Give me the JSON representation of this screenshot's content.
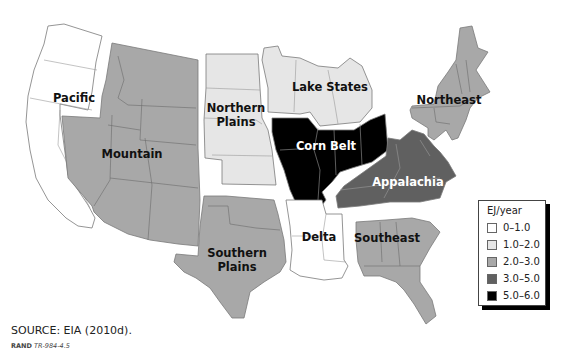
{
  "map": {
    "title": "",
    "unit_label": "EJ/year",
    "regions": [
      {
        "name": "Pacific",
        "bin": "0–1.0",
        "fill": "#ffffff",
        "label_color": "dark"
      },
      {
        "name": "Mountain",
        "bin": "2.0–3.0",
        "fill": "#a8a8a8",
        "label_color": "dark"
      },
      {
        "name": "Northern Plains",
        "label_line1": "Northern",
        "label_line2": "Plains",
        "bin": "1.0–2.0",
        "fill": "#e6e6e6",
        "label_color": "dark"
      },
      {
        "name": "Lake States",
        "bin": "1.0–2.0",
        "fill": "#e6e6e6",
        "label_color": "dark"
      },
      {
        "name": "Corn Belt",
        "bin": "5.0–6.0",
        "fill": "#000000",
        "label_color": "light"
      },
      {
        "name": "Northeast",
        "bin": "2.0–3.0",
        "fill": "#a8a8a8",
        "label_color": "dark"
      },
      {
        "name": "Appalachia",
        "bin": "3.0–5.0",
        "fill": "#606060",
        "label_color": "light"
      },
      {
        "name": "Southern Plains",
        "label_line1": "Southern",
        "label_line2": "Plains",
        "bin": "2.0–3.0",
        "fill": "#a8a8a8",
        "label_color": "dark"
      },
      {
        "name": "Delta",
        "bin": "0–1.0",
        "fill": "#ffffff",
        "label_color": "dark"
      },
      {
        "name": "Southeast",
        "bin": "2.0–3.0",
        "fill": "#a8a8a8",
        "label_color": "dark"
      }
    ]
  },
  "legend": {
    "title": "EJ/year",
    "items": [
      {
        "label": "0–1.0",
        "color": "#ffffff"
      },
      {
        "label": "1.0–2.0",
        "color": "#e6e6e6"
      },
      {
        "label": "2.0–3.0",
        "color": "#a8a8a8"
      },
      {
        "label": "3.0–5.0",
        "color": "#606060"
      },
      {
        "label": "5.0–6.0",
        "color": "#000000"
      }
    ]
  },
  "footer": {
    "source": "SOURCE: EIA (2010d).",
    "rand_org": "RAND",
    "rand_id": "TR-984-4.5"
  }
}
